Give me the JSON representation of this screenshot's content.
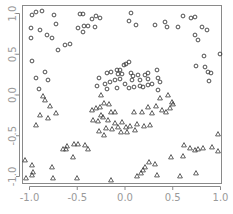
{
  "chart_data": {
    "type": "scatter",
    "title": "",
    "xlabel": "",
    "ylabel": "",
    "xlim": [
      -1.05,
      1.05
    ],
    "ylim": [
      -1.07,
      1.12
    ],
    "grid": false,
    "legend": null,
    "x_ticks": [
      -1.0,
      -0.5,
      0.0,
      0.5,
      1.0
    ],
    "x_tick_labels": [
      "-1.0",
      "-0.5",
      "0.0",
      "0.5",
      "1.0"
    ],
    "y_ticks": [
      -1.0,
      -0.5,
      0.0,
      0.5,
      1.0
    ],
    "y_tick_labels": [
      "-1.0",
      "-0.5",
      "0.0",
      "0.5",
      "1.0"
    ],
    "colors": {
      "marker": "#3a3a3a",
      "axis": "#8a8a8a",
      "tick_text": "#9a9a9a"
    },
    "series": [
      {
        "name": "class 1",
        "marker": "circle",
        "points_px": [
          [
            32,
            15
          ],
          [
            36,
            12
          ],
          [
            42,
            11
          ],
          [
            54,
            15
          ],
          [
            31,
            28
          ],
          [
            40,
            30
          ],
          [
            31,
            38
          ],
          [
            47,
            35
          ],
          [
            52,
            38
          ],
          [
            56,
            24
          ],
          [
            65,
            45
          ],
          [
            70,
            44
          ],
          [
            58,
            50
          ],
          [
            32,
            61
          ],
          [
            36,
            78
          ],
          [
            45,
            72
          ],
          [
            48,
            80
          ],
          [
            39,
            89
          ],
          [
            80,
            14
          ],
          [
            83,
            14
          ],
          [
            78,
            28
          ],
          [
            84,
            26
          ],
          [
            88,
            26
          ],
          [
            83,
            32
          ],
          [
            95,
            27
          ],
          [
            92,
            19
          ],
          [
            96,
            16
          ],
          [
            100,
            18
          ],
          [
            129,
            21
          ],
          [
            136,
            25
          ],
          [
            131,
            13
          ],
          [
            155,
            25
          ],
          [
            165,
            22
          ],
          [
            167,
            27
          ],
          [
            183,
            16
          ],
          [
            191,
            18
          ],
          [
            195,
            17
          ],
          [
            202,
            27
          ],
          [
            207,
            30
          ],
          [
            195,
            35
          ],
          [
            198,
            40
          ],
          [
            204,
            56
          ],
          [
            220,
            54
          ],
          [
            196,
            66
          ],
          [
            205,
            67
          ],
          [
            208,
            72
          ],
          [
            211,
            73
          ],
          [
            209,
            81
          ],
          [
            117,
            70
          ],
          [
            120,
            70
          ],
          [
            124,
            65
          ],
          [
            126,
            64
          ],
          [
            129,
            62
          ],
          [
            107,
            73
          ],
          [
            111,
            72
          ],
          [
            118,
            74
          ],
          [
            122,
            74
          ],
          [
            131,
            73
          ],
          [
            133,
            76
          ],
          [
            138,
            75
          ],
          [
            145,
            75
          ],
          [
            148,
            73
          ],
          [
            158,
            78
          ],
          [
            157,
            70
          ],
          [
            105,
            84
          ],
          [
            110,
            82
          ],
          [
            115,
            80
          ],
          [
            120,
            79
          ],
          [
            132,
            80
          ],
          [
            140,
            80
          ],
          [
            148,
            79
          ],
          [
            160,
            82
          ],
          [
            107,
            89
          ],
          [
            117,
            88
          ],
          [
            125,
            84
          ],
          [
            129,
            88
          ],
          [
            134,
            87
          ],
          [
            140,
            86
          ],
          [
            143,
            87
          ],
          [
            148,
            85
          ],
          [
            152,
            84
          ],
          [
            158,
            90
          ],
          [
            99,
            78
          ],
          [
            97,
            86
          ],
          [
            178,
            27
          ]
        ]
      },
      {
        "name": "class 2",
        "marker": "triangle",
        "points_px": [
          [
            101,
            95
          ],
          [
            104,
            103
          ],
          [
            100,
            107
          ],
          [
            96,
            108
          ],
          [
            109,
            104
          ],
          [
            111,
            112
          ],
          [
            115,
            112
          ],
          [
            92,
            110
          ],
          [
            93,
            120
          ],
          [
            101,
            115
          ],
          [
            98,
            121
          ],
          [
            103,
            117
          ],
          [
            108,
            120
          ],
          [
            115,
            123
          ],
          [
            122,
            122
          ],
          [
            118,
            127
          ],
          [
            121,
            132
          ],
          [
            126,
            127
          ],
          [
            130,
            126
          ],
          [
            137,
            124
          ],
          [
            144,
            126
          ],
          [
            150,
            125
          ],
          [
            135,
            130
          ],
          [
            127,
            132
          ],
          [
            112,
            129
          ],
          [
            106,
            128
          ],
          [
            104,
            135
          ],
          [
            99,
            131
          ],
          [
            134,
            112
          ],
          [
            142,
            112
          ],
          [
            152,
            113
          ],
          [
            148,
            107
          ],
          [
            156,
            106
          ],
          [
            162,
            110
          ],
          [
            166,
            112
          ],
          [
            170,
            108
          ],
          [
            172,
            102
          ],
          [
            160,
            98
          ],
          [
            168,
            95
          ],
          [
            173,
            104
          ],
          [
            218,
            134
          ],
          [
            184,
            145
          ],
          [
            190,
            148
          ],
          [
            195,
            150
          ],
          [
            198,
            149
          ],
          [
            203,
            148
          ],
          [
            212,
            147
          ],
          [
            218,
            151
          ],
          [
            171,
            157
          ],
          [
            183,
            156
          ],
          [
            149,
            162
          ],
          [
            145,
            167
          ],
          [
            143,
            170
          ],
          [
            141,
            173
          ],
          [
            137,
            176
          ],
          [
            155,
            164
          ],
          [
            157,
            175
          ],
          [
            180,
            176
          ],
          [
            196,
            173
          ],
          [
            32,
            165
          ],
          [
            33,
            172
          ],
          [
            32,
            175
          ],
          [
            52,
            167
          ],
          [
            63,
            149
          ],
          [
            67,
            146
          ],
          [
            74,
            144
          ],
          [
            78,
            144
          ],
          [
            85,
            145
          ],
          [
            88,
            149
          ],
          [
            73,
            157
          ],
          [
            66,
            149
          ],
          [
            25,
            160
          ],
          [
            26,
            178
          ],
          [
            53,
            178
          ],
          [
            77,
            178
          ],
          [
            111,
            180
          ],
          [
            43,
            96
          ],
          [
            45,
            100
          ],
          [
            50,
            106
          ],
          [
            56,
            113
          ],
          [
            40,
            115
          ],
          [
            48,
            118
          ],
          [
            36,
            125
          ]
        ]
      }
    ],
    "pixel_mapping": {
      "x0_px": 125,
      "x_px_per_unit": 95.5,
      "y0_px": 95,
      "y_px_per_unit": 81.5
    }
  }
}
